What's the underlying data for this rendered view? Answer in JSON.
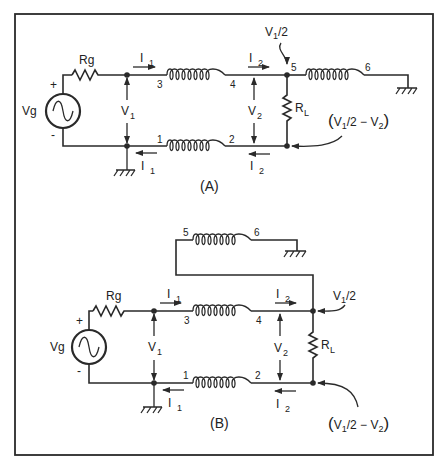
{
  "figure": {
    "type": "circuit-schematic"
  },
  "panels": [
    {
      "id": "A",
      "caption": "(A)",
      "source": {
        "label": "Vg",
        "plus": "+",
        "minus": "-"
      },
      "resistor_gen": "Rg",
      "resistor_load": {
        "main": "R",
        "sub": "L"
      },
      "currents": {
        "i1_top": {
          "main": "I",
          "sub": "1"
        },
        "i1_bot": {
          "main": "I",
          "sub": "1"
        },
        "i2_top": {
          "main": "I",
          "sub": "2"
        },
        "i2_bot": {
          "main": "I",
          "sub": "2"
        }
      },
      "voltages": {
        "v1": {
          "main": "V",
          "sub": "1"
        },
        "v2": {
          "main": "V",
          "sub": "2"
        }
      },
      "terminals": [
        "1",
        "2",
        "3",
        "4",
        "5",
        "6"
      ],
      "node_top_label": {
        "pre": "V",
        "sub": "1",
        "post": "/2"
      },
      "node_bottom_label": {
        "open": "(",
        "pre": "V",
        "sub1": "1",
        "mid": "/2 − V",
        "sub2": "2",
        "close": ")"
      }
    },
    {
      "id": "B",
      "caption": "(B)",
      "source": {
        "label": "Vg",
        "plus": "+",
        "minus": "-"
      },
      "resistor_gen": "Rg",
      "resistor_load": {
        "main": "R",
        "sub": "L"
      },
      "currents": {
        "i1_top": {
          "main": "I",
          "sub": "1"
        },
        "i1_bot": {
          "main": "I",
          "sub": "1"
        },
        "i2_top": {
          "main": "I",
          "sub": "2"
        },
        "i2_bot": {
          "main": "I",
          "sub": "2"
        }
      },
      "voltages": {
        "v1": {
          "main": "V",
          "sub": "1"
        },
        "v2": {
          "main": "V",
          "sub": "2"
        }
      },
      "terminals": [
        "1",
        "2",
        "3",
        "4",
        "5",
        "6"
      ],
      "node_top_label": {
        "pre": "V",
        "sub": "1",
        "post": "/2"
      },
      "node_bottom_label": {
        "open": "(",
        "pre": "V",
        "sub1": "1",
        "mid": "/2 − V",
        "sub2": "2",
        "close": ")"
      }
    }
  ]
}
